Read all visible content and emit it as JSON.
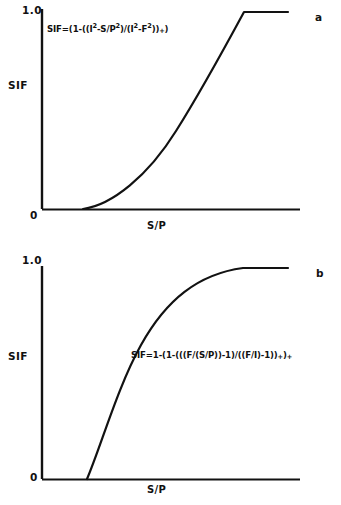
{
  "figure": {
    "panels": [
      {
        "id": "a",
        "letter": "a",
        "formula": {
          "full_text": "SIF=(1-((I2-S/P2)/(I2-F2))+)",
          "parts": [
            {
              "t": "SIF=(1-((I",
              "k": "base"
            },
            {
              "t": "2",
              "k": "sup"
            },
            {
              "t": "-S/P",
              "k": "base"
            },
            {
              "t": "2",
              "k": "sup"
            },
            {
              "t": ")/(I",
              "k": "base"
            },
            {
              "t": "2",
              "k": "sup"
            },
            {
              "t": "-F",
              "k": "base"
            },
            {
              "t": "2",
              "k": "sup"
            },
            {
              "t": "))",
              "k": "base"
            },
            {
              "t": "+",
              "k": "sub"
            },
            {
              "t": ")",
              "k": "base"
            }
          ]
        },
        "axes": {
          "y_label": "SIF",
          "x_label": "S/P",
          "y_tick_top": "1.0",
          "y_tick_bottom": "0"
        },
        "curve": {
          "shape": "convex-rising-then-plateau",
          "path": "M 83 209 C 112 205, 148 176, 176 131 C 200 93, 224 49, 244 12 L 288 12"
        }
      },
      {
        "id": "b",
        "letter": "b",
        "formula": {
          "full_text": "SIF=1-(1-(((F/(S/P))-1)/((F/I)-1))+)+",
          "parts": [
            {
              "t": "SIF=1-(1-(((F/(S/P))-1)/((F/I)-1))",
              "k": "base"
            },
            {
              "t": "+",
              "k": "sub"
            },
            {
              "t": ")",
              "k": "base"
            },
            {
              "t": "+",
              "k": "sub"
            }
          ]
        },
        "axes": {
          "y_label": "SIF",
          "x_label": "S/P",
          "y_tick_top": "1.0",
          "y_tick_bottom": "0"
        },
        "curve": {
          "shape": "concave-saturating",
          "path": "M 87 229 C 101 196, 118 136, 141 95 C 166 50, 198 24, 243 18 L 288 18"
        }
      }
    ]
  },
  "chart_data": [
    {
      "type": "line",
      "title": "a",
      "xlabel": "S/P",
      "ylabel": "SIF",
      "ylim": [
        0,
        1.0
      ],
      "yticks": [
        0,
        1.0
      ],
      "ytick_labels": [
        "0",
        "1.0"
      ],
      "xticks": [],
      "grid": false,
      "legend": false,
      "annotation": "SIF=(1-((I2-S/P2)/(I2-F2))+)",
      "series": [
        {
          "name": "SIF (squared form)",
          "x": [
            0.0,
            0.2,
            0.3,
            0.4,
            0.5,
            0.6,
            0.7,
            0.8,
            0.9,
            1.0,
            1.2
          ],
          "y": [
            0.0,
            0.0,
            0.02,
            0.08,
            0.18,
            0.33,
            0.52,
            0.72,
            0.9,
            1.0,
            1.0
          ]
        }
      ]
    },
    {
      "type": "line",
      "title": "b",
      "xlabel": "S/P",
      "ylabel": "SIF",
      "ylim": [
        0,
        1.0
      ],
      "yticks": [
        0,
        1.0
      ],
      "ytick_labels": [
        "0",
        "1.0"
      ],
      "xticks": [],
      "grid": false,
      "legend": false,
      "annotation": "SIF=1-(1-(((F/(S/P))-1)/((F/I)-1))+)+",
      "series": [
        {
          "name": "SIF (ratio form)",
          "x": [
            0.0,
            0.22,
            0.28,
            0.35,
            0.45,
            0.55,
            0.7,
            0.85,
            1.0,
            1.2
          ],
          "y": [
            0.0,
            0.0,
            0.22,
            0.5,
            0.72,
            0.86,
            0.95,
            0.99,
            1.0,
            1.0
          ]
        }
      ]
    }
  ],
  "style": {
    "ink": "#121212",
    "background": "#ffffff"
  }
}
